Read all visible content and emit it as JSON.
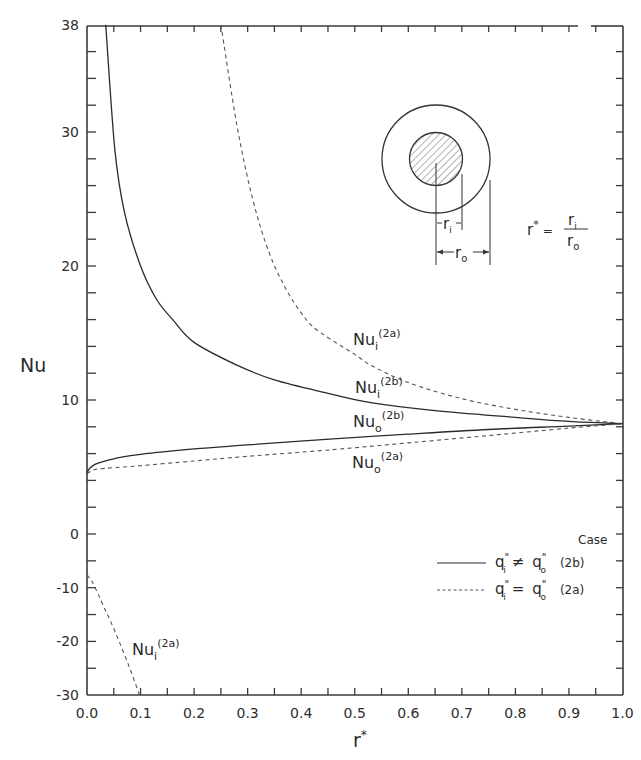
{
  "chart_data": {
    "type": "line",
    "title": "",
    "xlabel": "r*",
    "ylabel": "Nu",
    "xlim": [
      0.0,
      1.0
    ],
    "ylim": [
      -30,
      38
    ],
    "y_axis_note": "Broken scale: Nu from 0 to 38 uses ~13.4 px/unit; Nu from -30 to 0 compressed to ~5.4 px/unit",
    "grid": false,
    "x_ticks": [
      "0.0",
      "0.1",
      "0.2",
      "0.3",
      "0.4",
      "0.5",
      "0.6",
      "0.7",
      "0.8",
      "0.9",
      "1.0"
    ],
    "y_ticks": [
      "38",
      "30",
      "20",
      "10",
      "0",
      "-10",
      "-20",
      "-30"
    ],
    "series": [
      {
        "name": "Nu_i^(2b)",
        "case": "2b",
        "style": "solid",
        "x": [
          0.035,
          0.052,
          0.07,
          0.1,
          0.13,
          0.16,
          0.2,
          0.28,
          0.35,
          0.45,
          0.53,
          0.65,
          0.8,
          0.9,
          1.0
        ],
        "y": [
          38,
          28.7,
          24.0,
          20.0,
          17.5,
          16.0,
          14.3,
          12.6,
          11.5,
          10.5,
          9.8,
          9.2,
          8.7,
          8.4,
          8.23
        ]
      },
      {
        "name": "Nu_i^(2a)",
        "case": "2a",
        "style": "dashed",
        "x": [
          0.25,
          0.28,
          0.31,
          0.34,
          0.37,
          0.4,
          0.43,
          0.5,
          0.53,
          0.6,
          0.7,
          0.8,
          0.9,
          1.0
        ],
        "y": [
          38,
          30.5,
          24.9,
          21.0,
          18.4,
          16.5,
          15.2,
          13.4,
          12.6,
          11.3,
          10.1,
          9.3,
          8.7,
          8.23
        ]
      },
      {
        "name": "Nu_o^(2b)",
        "case": "2b",
        "style": "solid",
        "x": [
          0.0,
          0.005,
          0.015,
          0.03,
          0.06,
          0.1,
          0.2,
          0.3,
          0.46,
          0.6,
          0.75,
          0.9,
          1.0
        ],
        "y": [
          4.55,
          4.9,
          5.2,
          5.4,
          5.7,
          5.95,
          6.35,
          6.65,
          7.1,
          7.45,
          7.8,
          8.05,
          8.23
        ]
      },
      {
        "name": "Nu_o^(2a)",
        "case": "2a",
        "style": "dashed",
        "x": [
          0.0,
          0.01,
          0.02,
          0.05,
          0.1,
          0.2,
          0.3,
          0.46,
          0.6,
          0.75,
          0.9,
          1.0
        ],
        "y": [
          4.5,
          4.75,
          4.85,
          4.95,
          5.1,
          5.45,
          5.8,
          6.3,
          6.8,
          7.35,
          7.9,
          8.23
        ]
      },
      {
        "name": "Nu_i^(2a) (negative branch)",
        "case": "2a",
        "style": "dashed",
        "x": [
          0.0,
          0.01,
          0.02,
          0.03,
          0.043,
          0.06,
          0.08,
          0.098
        ],
        "y": [
          -7.6,
          -9.0,
          -11.0,
          -13.3,
          -16.0,
          -20.0,
          -25.0,
          -30.0
        ]
      }
    ],
    "annotations": [
      {
        "text": "Nu_i^(2a)",
        "near": "upper dashed curve",
        "x": 0.52,
        "y": 15.5
      },
      {
        "text": "Nu_i^(2b)",
        "near": "upper solid curve",
        "x": 0.52,
        "y": 10.5
      },
      {
        "text": "Nu_o^(2b)",
        "near": "lower solid curve",
        "x": 0.52,
        "y": 7.8
      },
      {
        "text": "Nu_o^(2a)",
        "near": "lower dashed curve",
        "x": 0.52,
        "y": 5.0
      },
      {
        "text": "Nu_i^(2a)",
        "near": "negative dashed curve",
        "x": 0.14,
        "y": -20
      }
    ],
    "legend": {
      "position": "lower right",
      "header": "Case",
      "entries": [
        {
          "style": "solid",
          "label": "q_i'' ≠ q_o''",
          "case": "(2b)"
        },
        {
          "style": "dashed",
          "label": "q_i'' = q_o''",
          "case": "(2a)"
        }
      ]
    },
    "inset": {
      "description": "Concentric annulus cross-section: hatched inner circle radius r_i, outer circle radius r_o",
      "labels": [
        "r_i",
        "r_o"
      ],
      "formula": "r* = r_i / r_o"
    }
  },
  "labels": {
    "ylabel": "Nu",
    "xlabel_base": "r",
    "xlabel_sup": "*",
    "curves": {
      "nu_i_2a_upper": {
        "base": "Nu",
        "sub": "i",
        "sup": "(2a)"
      },
      "nu_i_2b": {
        "base": "Nu",
        "sub": "i",
        "sup": "(2b)"
      },
      "nu_o_2b": {
        "base": "Nu",
        "sub": "o",
        "sup": "(2b)"
      },
      "nu_o_2a": {
        "base": "Nu",
        "sub": "o",
        "sup": "(2a)"
      },
      "nu_i_2a_lower": {
        "base": "Nu",
        "sub": "i",
        "sup": "(2a)"
      }
    },
    "legend": {
      "header": "Case",
      "row1_lhs": "q",
      "row1_op": "≠",
      "row1_rhs": "q",
      "row1_case": "(2b)",
      "row2_lhs": "q",
      "row2_op": "=",
      "row2_rhs": "q",
      "row2_case": "(2a)",
      "prime": "\"",
      "sub_i": "i",
      "sub_o": "o"
    },
    "inset": {
      "ri_base": "r",
      "ri_sub": "i",
      "ro_base": "r",
      "ro_sub": "o",
      "formula_lhs": "r",
      "formula_star": "*",
      "formula_eq": "=",
      "num_base": "r",
      "num_sub": "i",
      "den_base": "r",
      "den_sub": "o"
    }
  },
  "colors": {
    "ink": "#2a2a2a",
    "dashed_ink": "#555555",
    "background": "#ffffff"
  }
}
